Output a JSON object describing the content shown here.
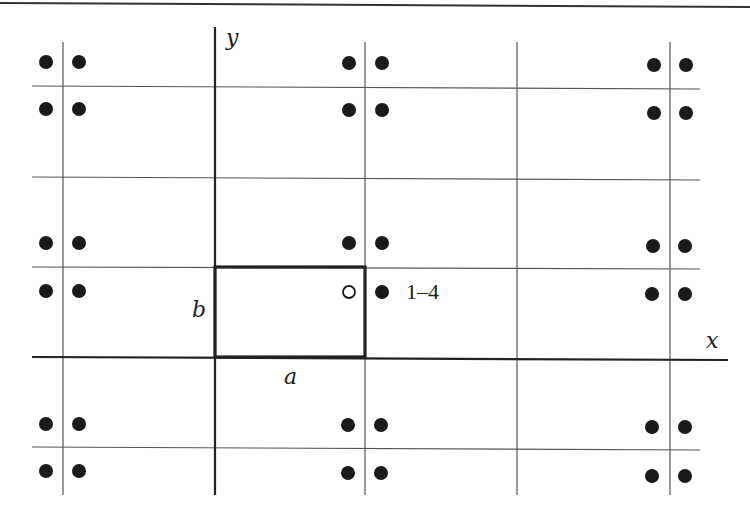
{
  "figure": {
    "colors": {
      "ink": "#1a1a1a",
      "grid": "#555555",
      "background": "#ffffff"
    }
  },
  "axes": {
    "x_label": "x",
    "y_label": "y"
  },
  "unit_cell": {
    "a_label": "a",
    "b_label": "b"
  },
  "annotations": {
    "position_label": "1–4"
  },
  "lattice": {
    "vertical_lines_x": [
      63,
      365,
      517,
      670
    ],
    "horizontal_lines_y": [
      86,
      178,
      267,
      447
    ],
    "dot_columns_x": [
      [
        46,
        79
      ],
      [
        349,
        382
      ],
      [
        653,
        686
      ]
    ],
    "dot_rows_y": [
      [
        62,
        109
      ],
      [
        243,
        291
      ],
      [
        424,
        471
      ]
    ],
    "open_circle": {
      "x": 349,
      "y": 291
    }
  }
}
